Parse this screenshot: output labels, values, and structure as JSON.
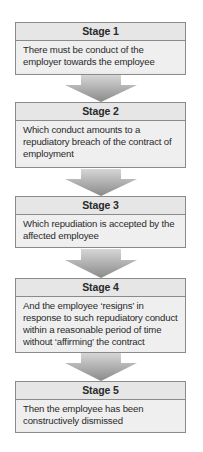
{
  "stages": [
    {
      "title": "Stage 1",
      "text": "There must be conduct of the employer towards the employee"
    },
    {
      "title": "Stage 2",
      "text": "Which conduct amounts to a repudiatory breach of the contract of employment"
    },
    {
      "title": "Stage 3",
      "text": "Which repudiation is accepted by the affected employee"
    },
    {
      "title": "Stage 4",
      "text": "And the employee ‘resigns’ in response to such repudiatory conduct within a reasonable period of time without ‘affirming’ the contract"
    },
    {
      "title": "Stage 5",
      "text": "Then the employee has been constructively dismissed"
    }
  ],
  "colors": {
    "box_fill": "#ececec",
    "box_border": "#8a8a8a",
    "arrow_light": "#cfcfcf",
    "arrow_dark": "#8c8c8c"
  }
}
